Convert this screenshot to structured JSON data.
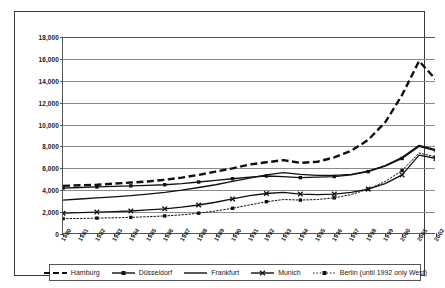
{
  "chart_data": {
    "type": "line",
    "title": "",
    "subtitle": "",
    "xlabel": "",
    "ylabel": "",
    "grid": true,
    "legend_position": "bottom",
    "ylim": [
      0,
      18000
    ],
    "ytick_values": [
      0,
      2000,
      4000,
      6000,
      8000,
      10000,
      12000,
      14000,
      16000,
      18000
    ],
    "ytick_labels": [
      "0",
      "2,000",
      "4,000",
      "6,000",
      "8,000",
      "10,000",
      "12,000",
      "14,000",
      "16,000",
      "18,000"
    ],
    "categories": [
      "1980",
      "1981",
      "1982",
      "1983",
      "1984",
      "1985",
      "1986",
      "1987",
      "1988",
      "1989",
      "1990",
      "1991",
      "1992",
      "1993",
      "1994",
      "1995",
      "1996",
      "1997",
      "1998",
      "1999",
      "2000",
      "2001",
      "2002"
    ],
    "series": [
      {
        "name": "Hamburg",
        "style": "dashed",
        "marker": "none",
        "color": "#111111",
        "values": [
          4400,
          4450,
          4500,
          4600,
          4700,
          4800,
          4950,
          5150,
          5400,
          5700,
          6000,
          6350,
          6550,
          6750,
          6500,
          6600,
          7000,
          7600,
          8600,
          10200,
          12700,
          15800,
          14100
        ]
      },
      {
        "name": "Düsseldorf",
        "style": "solid",
        "marker": "square",
        "color": "#111111",
        "values": [
          4200,
          4250,
          4300,
          4350,
          4400,
          4450,
          4500,
          4600,
          4750,
          4900,
          5050,
          5200,
          5300,
          5250,
          5150,
          5200,
          5250,
          5400,
          5700,
          6200,
          6900,
          8000,
          7600
        ]
      },
      {
        "name": "Frankfurt",
        "style": "solid",
        "marker": "none",
        "color": "#111111",
        "values": [
          3100,
          3200,
          3300,
          3400,
          3500,
          3650,
          3800,
          4000,
          4250,
          4500,
          4800,
          5100,
          5400,
          5600,
          5450,
          5350,
          5350,
          5450,
          5750,
          6250,
          7000,
          8100,
          7700
        ]
      },
      {
        "name": "Munich",
        "style": "solid",
        "marker": "x",
        "color": "#111111",
        "values": [
          1900,
          1950,
          2000,
          2050,
          2100,
          2200,
          2300,
          2450,
          2650,
          2900,
          3200,
          3500,
          3700,
          3800,
          3650,
          3600,
          3650,
          3800,
          4100,
          4600,
          5400,
          7200,
          6900
        ]
      },
      {
        "name": "Berlin (until 1992 only West)",
        "style": "dotted",
        "marker": "square",
        "color": "#111111",
        "values": [
          1400,
          1420,
          1450,
          1480,
          1520,
          1580,
          1650,
          1750,
          1900,
          2100,
          2350,
          2650,
          2950,
          3150,
          3100,
          3150,
          3300,
          3600,
          4100,
          4800,
          5800,
          7400,
          7050
        ]
      }
    ]
  },
  "legend": {
    "items": [
      {
        "label": "Hamburg",
        "key": "dashed-line-key"
      },
      {
        "label": "Düsseldorf",
        "key": "square-marker-line-key"
      },
      {
        "label": "Frankfurt",
        "key": "solid-line-key"
      },
      {
        "label": "Munich",
        "key": "x-marker-line-key"
      },
      {
        "label": "Berlin (until 1992 only West)",
        "key": "dotted-square-marker-key"
      }
    ]
  }
}
